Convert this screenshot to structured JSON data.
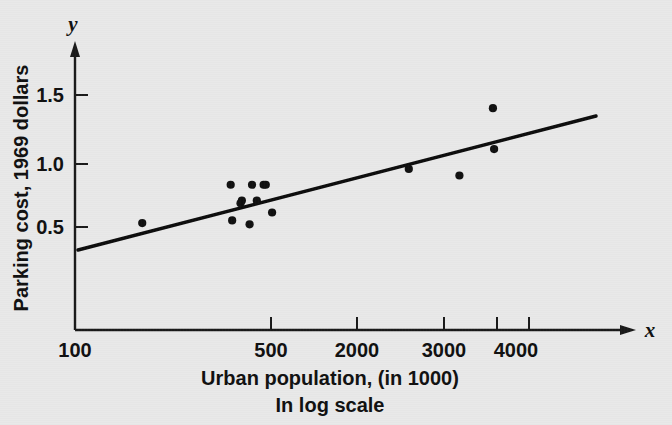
{
  "chart_data": {
    "type": "scatter",
    "title": "",
    "xlabel": "Urban population, (in 1000)",
    "xlabel_sub": "In log scale",
    "ylabel": "Parking cost, 1969 dollars",
    "x_axis_symbol": "x",
    "y_axis_symbol": "y",
    "xscale": "log",
    "yscale": "linear",
    "xlim": [
      100,
      4600
    ],
    "ylim": [
      0,
      1.75
    ],
    "grid": false,
    "legend": null,
    "xticks": [
      100,
      500,
      2000,
      3000,
      4000
    ],
    "xtick_labels": [
      "100",
      "500",
      "2000",
      "3000",
      "4000"
    ],
    "yticks": [
      0.5,
      1.0,
      1.5
    ],
    "ytick_labels": [
      "0.5",
      "1.0",
      "1.5"
    ],
    "points": [
      {
        "x": 180,
        "y": 0.53
      },
      {
        "x": 390,
        "y": 0.82
      },
      {
        "x": 395,
        "y": 0.55
      },
      {
        "x": 425,
        "y": 0.68
      },
      {
        "x": 430,
        "y": 0.7
      },
      {
        "x": 460,
        "y": 0.52
      },
      {
        "x": 470,
        "y": 0.82
      },
      {
        "x": 490,
        "y": 0.7
      },
      {
        "x": 520,
        "y": 0.82
      },
      {
        "x": 530,
        "y": 0.82
      },
      {
        "x": 560,
        "y": 0.61
      },
      {
        "x": 1850,
        "y": 0.94
      },
      {
        "x": 2880,
        "y": 0.89
      },
      {
        "x": 3860,
        "y": 1.4
      },
      {
        "x": 3900,
        "y": 1.09
      }
    ],
    "fit_line": {
      "type": "linear-regression",
      "x_start": 108,
      "y_start": 0.42,
      "x_end": 4580,
      "y_end": 1.37
    },
    "annotations": []
  }
}
